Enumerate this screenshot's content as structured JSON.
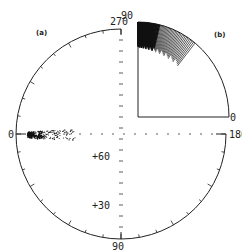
{
  "figure": {
    "panel_a_label": "(a)",
    "panel_b_label": "(b)",
    "circle_labels": {
      "top": "270",
      "left": "0",
      "right": "180",
      "bottom": "90"
    },
    "axis_labels": {
      "plus60": "+60",
      "plus30": "+30"
    },
    "quadrant_labels": {
      "top": "90",
      "right": "0"
    }
  },
  "chart_data": [
    {
      "type": "scatter",
      "title": "(a)",
      "description": "Polar plot with azimuth labels 0, 90, 180, 270; scatter of points clustered near azimuth 0 at low elevation",
      "axis_ticks": [
        "0",
        "90",
        "180",
        "270"
      ],
      "radial_ticks": [
        "+30",
        "+60"
      ],
      "cluster": {
        "azimuth_approx": 0,
        "spread": "narrow, extending toward center"
      }
    },
    {
      "type": "line",
      "title": "(b)",
      "description": "Quarter-circle plot 0 to 90 with dense radial line segments concentrated near the 90 end along the arc",
      "axis_ticks": [
        "0",
        "90"
      ]
    }
  ]
}
